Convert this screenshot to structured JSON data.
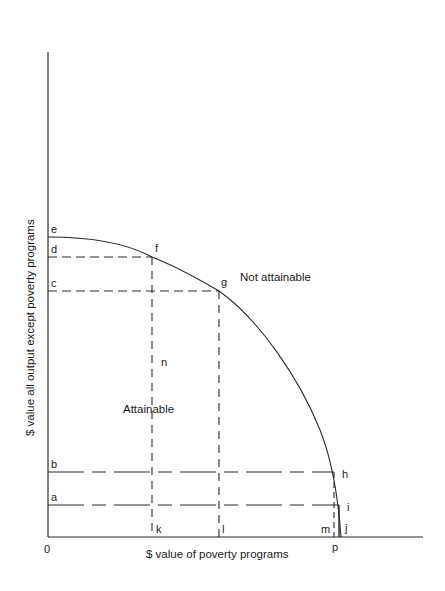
{
  "diagram": {
    "type": "production-possibilities-frontier",
    "x_axis_label": "$ value of poverty programs",
    "y_axis_label": "$ value all output except poverty programs",
    "origin_label": "0",
    "regions": {
      "inside": "Attainable",
      "outside": "Not attainable"
    },
    "points": {
      "e": "e",
      "f": "f",
      "g": "g",
      "h": "h",
      "i": "i",
      "j": "j",
      "n": "n"
    },
    "y_axis_marks": {
      "a": "a",
      "b": "b",
      "c": "c",
      "d": "d"
    },
    "x_axis_marks": {
      "k": "k",
      "l": "l",
      "m": "m",
      "p": "p"
    },
    "colors": {
      "line": "#2a2a2a",
      "background": "#ffffff"
    }
  }
}
